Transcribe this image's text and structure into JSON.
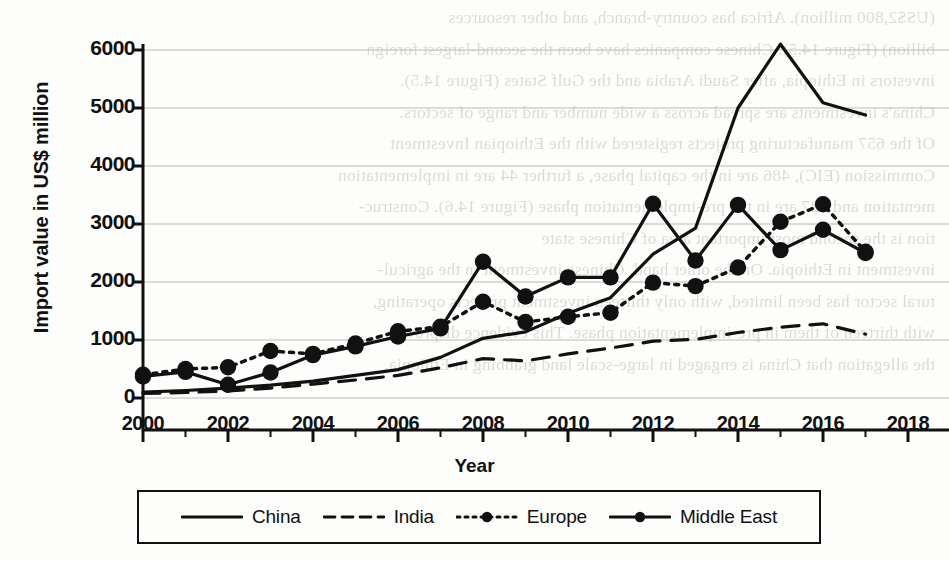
{
  "chart_data": {
    "type": "line",
    "title": "",
    "xlabel": "Year",
    "ylabel": "Import value in US$ million",
    "xlim": [
      2000,
      2018
    ],
    "ylim": [
      0,
      6500
    ],
    "yticks": [
      0,
      1000,
      2000,
      3000,
      4000,
      5000,
      6000
    ],
    "xticks": [
      2000,
      2002,
      2004,
      2006,
      2008,
      2010,
      2012,
      2014,
      2016,
      2018
    ],
    "minor_xticks": [
      2001,
      2003,
      2005,
      2007,
      2009,
      2011,
      2013,
      2015,
      2017
    ],
    "grid": "horizontal",
    "legend_position": "below",
    "x": [
      2000,
      2001,
      2002,
      2003,
      2004,
      2005,
      2006,
      2007,
      2008,
      2009,
      2010,
      2011,
      2012,
      2013,
      2014,
      2015,
      2016,
      2017
    ],
    "series": [
      {
        "name": "China",
        "style": "solid",
        "marker": "none",
        "color": "#111111",
        "values": [
          100,
          130,
          170,
          220,
          290,
          390,
          490,
          700,
          1030,
          1140,
          1460,
          1730,
          2480,
          2930,
          5000,
          6100,
          5090,
          4880
        ]
      },
      {
        "name": "India",
        "style": "dashed",
        "marker": "none",
        "color": "#111111",
        "values": [
          80,
          95,
          120,
          170,
          240,
          310,
          390,
          520,
          680,
          640,
          760,
          860,
          980,
          1010,
          1130,
          1220,
          1280,
          1100
        ]
      },
      {
        "name": "Europe",
        "style": "dotted",
        "marker": "circle",
        "color": "#111111",
        "values": [
          400,
          500,
          530,
          810,
          760,
          940,
          1150,
          1230,
          1660,
          1310,
          1400,
          1470,
          1990,
          1930,
          2250,
          3040,
          3340,
          2520
        ]
      },
      {
        "name": "Middle East",
        "style": "solid",
        "marker": "circle",
        "color": "#111111",
        "values": [
          370,
          450,
          230,
          440,
          740,
          890,
          1060,
          1200,
          2350,
          1750,
          2080,
          2080,
          3350,
          2370,
          3330,
          2550,
          2900,
          2500
        ]
      }
    ]
  },
  "legend": {
    "items": [
      {
        "label": "China",
        "icon": "solid-line-icon"
      },
      {
        "label": "India",
        "icon": "dashed-line-icon"
      },
      {
        "label": "Europe",
        "icon": "dotted-marker-line-icon"
      },
      {
        "label": "Middle East",
        "icon": "solid-marker-line-icon"
      }
    ]
  },
  "page_bleed": {
    "lines": [
      "(US$2,800 million). Africa has country-branch, and other resources",
      "billion) (Figure 14.5). Chinese companies have been the second-largest foreign",
      "investors in Ethiopia, after Saudi Arabia and the Gulf States (Figure 14.5).",
      "China's investments are spread across a wide number and range of sectors.",
      "Of the 657 manufacturing projects registered with the Ethiopian Investment",
      "Commission (EIC), 486 are in the capital phase, a further 44 are in implementation",
      "mentation and 127 are in the pre-implementation phase (Figure 14.6). Construc-",
      "tion is the second most important area of Chinese state",
      "investment in Ethiopia. On the other hand, Chinese investment in the agricul-",
      "tural sector has been limited, with only thirteen investment projects operating,",
      "with thirteen of them in pre-implementation phase. This evidence disproves",
      "the allegation that China is engaged in large-scale land grabbing in Ethiopia."
    ]
  }
}
